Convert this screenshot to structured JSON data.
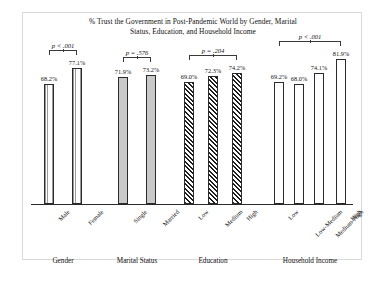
{
  "chart_data": {
    "type": "bar",
    "title_line1": "% Trust the Government in Post-Pandemic World by Gender, Marital",
    "title_line2": "Status, Education, and Household Income",
    "xlabel": "",
    "ylabel": "",
    "ylim": [
      0,
      100
    ],
    "grid": false,
    "legend": "none",
    "categories": [
      "Male",
      "Female",
      "Single",
      "Married",
      "Low",
      "Medium",
      "High",
      "Low",
      "Low-Medium",
      "Medium-High",
      "High"
    ],
    "values": [
      68.2,
      77.1,
      71.9,
      73.2,
      69.0,
      72.3,
      74.2,
      69.2,
      68.0,
      74.1,
      81.9
    ],
    "value_labels": [
      "68.2%",
      "77.1%",
      "71.9%",
      "73.2%",
      "69.0%",
      "72.3%",
      "74.2%",
      "69.2%",
      "68.0%",
      "74.1%",
      "81.9%"
    ],
    "groups": [
      {
        "name": "Gender",
        "label": "Gender",
        "fill": "fill-dots",
        "p_value": "p < .001",
        "p_prefix": "p",
        "p_rest": " < .001",
        "bars": [
          {
            "tick": "Male",
            "value": 68.2,
            "label": "68.2%"
          },
          {
            "tick": "Female",
            "value": 77.1,
            "label": "77.1%"
          }
        ]
      },
      {
        "name": "Marital Status",
        "label": "Marital Status",
        "fill": "fill-gray",
        "p_value": "p = .576",
        "p_prefix": "p",
        "p_rest": " = .576",
        "bars": [
          {
            "tick": "Single",
            "value": 71.9,
            "label": "71.9%"
          },
          {
            "tick": "Married",
            "value": 73.2,
            "label": "73.2%"
          }
        ]
      },
      {
        "name": "Education",
        "label": "Education",
        "fill": "fill-hatch",
        "p_value": "p = .204",
        "p_prefix": "p",
        "p_rest": " = .204",
        "bars": [
          {
            "tick": "Low",
            "value": 69.0,
            "label": "69.0%"
          },
          {
            "tick": "Medium",
            "value": 72.3,
            "label": "72.3%"
          },
          {
            "tick": "High",
            "value": 74.2,
            "label": "74.2%"
          }
        ]
      },
      {
        "name": "Household Income",
        "label": "Household Income",
        "fill": "fill-white",
        "p_value": "p < .001",
        "p_prefix": "p",
        "p_rest": " < .001",
        "bars": [
          {
            "tick": "Low",
            "value": 69.2,
            "label": "69.2%"
          },
          {
            "tick": "Low-Medium",
            "value": 68.0,
            "label": "68.0%"
          },
          {
            "tick": "Medium-High",
            "value": 74.1,
            "label": "74.1%"
          },
          {
            "tick": "High",
            "value": 81.9,
            "label": "81.9%"
          }
        ]
      }
    ]
  }
}
